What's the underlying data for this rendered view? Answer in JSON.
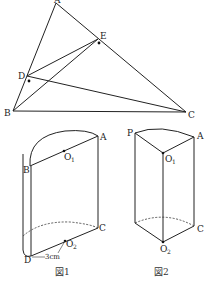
{
  "triangle": {
    "points": {
      "A": {
        "label": "A",
        "x": 56,
        "y": 2
      },
      "B": {
        "label": "B",
        "x": 13,
        "y": 111
      },
      "C": {
        "label": "C",
        "x": 186,
        "y": 111
      },
      "D": {
        "label": "D",
        "x": 27,
        "y": 75
      },
      "E": {
        "label": "E",
        "x": 98,
        "y": 38
      }
    },
    "segments": [
      "AB",
      "AC",
      "BC",
      "DE",
      "DC",
      "BE"
    ],
    "right_angle_marks": [
      "D",
      "E"
    ]
  },
  "figure1": {
    "caption": "図1",
    "labels": {
      "A": "A",
      "B": "B",
      "C": "C",
      "D": "D",
      "O1": "O",
      "O1_sub": "1",
      "O2": "O",
      "O2_sub": "2"
    },
    "dimension": "3cm"
  },
  "figure2": {
    "caption": "図2",
    "labels": {
      "P": "P",
      "A": "A",
      "C": "C",
      "O1": "O",
      "O1_sub": "1",
      "O2": "O",
      "O2_sub": "2"
    }
  }
}
